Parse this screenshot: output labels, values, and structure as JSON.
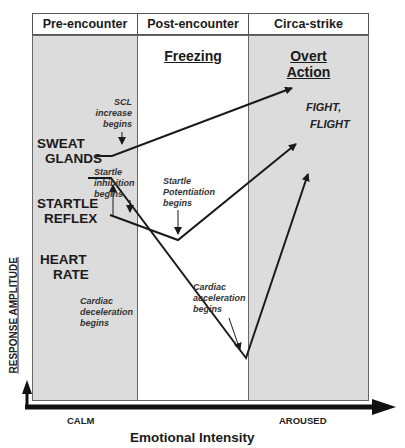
{
  "phases": [
    {
      "header": "Pre-encounter",
      "title": "",
      "shade": "gray"
    },
    {
      "header": "Post-encounter",
      "title": "Freezing",
      "shade": "white"
    },
    {
      "header": "Circa-strike",
      "title": "Overt Action",
      "title_lines": [
        "Overt",
        "Action"
      ],
      "shade": "gray"
    }
  ],
  "measures": {
    "sweat_glands": [
      "SWEAT",
      "GLANDS"
    ],
    "startle_reflex": [
      "STARTLE",
      "REFLEX"
    ],
    "heart_rate": [
      "HEART",
      "RATE"
    ]
  },
  "annotations": {
    "scl": [
      "SCL increase",
      "begins"
    ],
    "startle_inhibition": [
      "Startle",
      "inhibition",
      "begins"
    ],
    "startle_potentiation": [
      "Startle",
      "Potentiation",
      "begins"
    ],
    "cardiac_deceleration": [
      "Cardiac",
      "deceleration",
      "begins"
    ],
    "cardiac_acceleration": [
      "Cardiac",
      "acceleration",
      "begins"
    ]
  },
  "outcome": [
    "FIGHT,",
    "FLIGHT"
  ],
  "axes": {
    "y_label": "RESPONSE AMPLITUDE",
    "x_label": "Emotional Intensity",
    "x_min_label": "CALM",
    "x_max_label": "AROUSED"
  },
  "colors": {
    "shade": "#dcdcdc",
    "line": "#1a1a1a"
  }
}
